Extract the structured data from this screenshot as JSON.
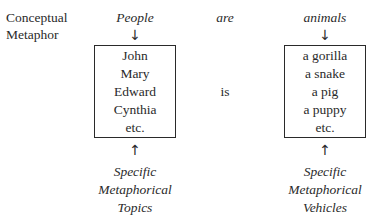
{
  "diagram": {
    "row_label": [
      "Conceptual",
      "Metaphor"
    ],
    "header": {
      "topic_domain": "People",
      "copula": "are",
      "vehicle_domain": "animals"
    },
    "arrows": {
      "down": "↓",
      "up": "↑"
    },
    "topics": [
      "John",
      "Mary",
      "Edward",
      "Cynthia",
      "etc."
    ],
    "middle_word": "is",
    "vehicles": [
      "a gorilla",
      "a snake",
      "a pig",
      "a puppy",
      "etc."
    ],
    "topic_caption": [
      "Specific",
      "Metaphorical",
      "Topics"
    ],
    "vehicle_caption": [
      "Specific",
      "Metaphorical",
      "Vehicles"
    ]
  }
}
